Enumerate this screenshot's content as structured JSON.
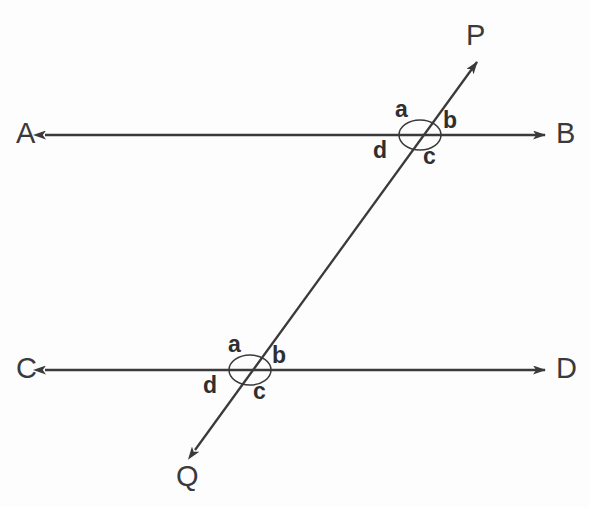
{
  "figure": {
    "background_color": "#fdfdfd",
    "stroke_color": "#3a3a3c",
    "label_color": "#2f2f31"
  },
  "lines": [
    {
      "id": "line-ab",
      "name": "line-AB",
      "kind": "double-headed-arrow",
      "start_label": "A",
      "end_label": "B",
      "x1": 45,
      "y1": 135,
      "x2": 545,
      "y2": 135
    },
    {
      "id": "line-cd",
      "name": "line-CD",
      "kind": "double-headed-arrow",
      "start_label": "C",
      "end_label": "D",
      "x1": 45,
      "y1": 370,
      "x2": 545,
      "y2": 370
    },
    {
      "id": "line-pq",
      "name": "transversal-PQ",
      "kind": "double-headed-arrow",
      "start_label": "Q",
      "end_label": "P",
      "x1": 195,
      "y1": 450,
      "x2": 477,
      "y2": 62
    }
  ],
  "endpoint_labels": {
    "A": "A",
    "B": "B",
    "C": "C",
    "D": "D",
    "P": "P",
    "Q": "Q"
  },
  "intersections": [
    {
      "id": "upper",
      "name": "upper-intersection",
      "on_line": "line-AB",
      "x": 420,
      "y": 135,
      "ellipse_rx": 21,
      "ellipse_ry": 15,
      "angles": {
        "a": "a",
        "b": "b",
        "c": "c",
        "d": "d"
      }
    },
    {
      "id": "lower",
      "name": "lower-intersection",
      "on_line": "line-CD",
      "x": 250,
      "y": 370,
      "ellipse_rx": 21,
      "ellipse_ry": 15,
      "angles": {
        "a": "a",
        "b": "b",
        "c": "c",
        "d": "d"
      }
    }
  ]
}
